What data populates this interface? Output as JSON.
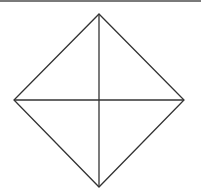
{
  "figure": {
    "shape": "rhombus-with-diagonals",
    "stroke_color": "#333333",
    "border_color": "#7a7a7a",
    "vertices": {
      "top": [
        99,
        14
      ],
      "right": [
        184,
        100
      ],
      "bottom": [
        99,
        187
      ],
      "left": [
        14,
        100
      ]
    },
    "center": [
      99,
      100
    ]
  }
}
